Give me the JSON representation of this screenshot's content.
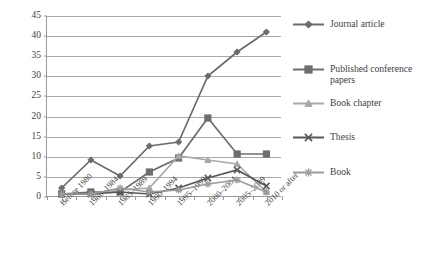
{
  "chart_data": {
    "type": "line",
    "title": "",
    "subtitle": "",
    "xlabel": "",
    "ylabel": "",
    "ylim": [
      0,
      45
    ],
    "ytick_step": 5,
    "yticks": [
      0,
      5,
      10,
      15,
      20,
      25,
      30,
      35,
      40,
      45
    ],
    "grid": "horizontal",
    "legend_position": "right",
    "categories": [
      "Before 1980",
      "1980–1984",
      "1985–1989",
      "1990–1994",
      "1995–1999",
      "2000–2004",
      "2005–2009",
      "2010 or after"
    ],
    "series": [
      {
        "name": "Journal article",
        "marker": "diamond",
        "color": "#6b6b6b",
        "values": [
          2,
          9,
          5,
          12.5,
          13.5,
          30,
          36,
          41
        ]
      },
      {
        "name": "Published conference papers",
        "marker": "square",
        "color": "#6e6e6e",
        "values": [
          0.5,
          1,
          1,
          6,
          9.5,
          19.5,
          10.5,
          10.5
        ]
      },
      {
        "name": "Book chapter",
        "marker": "triangle",
        "color": "#a8a8a8",
        "values": [
          0.5,
          0.5,
          1.5,
          2,
          10,
          9,
          8,
          1
        ]
      },
      {
        "name": "Thesis",
        "marker": "x",
        "color": "#575757",
        "values": [
          0.5,
          0.5,
          1,
          0.5,
          2,
          4.5,
          6.5,
          2.5
        ]
      },
      {
        "name": "Book",
        "marker": "asterisk",
        "color": "#9b9b9b",
        "values": [
          0.5,
          0.5,
          2,
          1,
          1.5,
          3,
          4,
          1
        ]
      }
    ]
  },
  "legend": {
    "items": [
      {
        "label": "Journal article"
      },
      {
        "label": "Published conference papers"
      },
      {
        "label": "Book chapter"
      },
      {
        "label": "Thesis"
      },
      {
        "label": "Book"
      }
    ]
  },
  "axes": {
    "y_tick_labels": [
      "0",
      "5",
      "10",
      "15",
      "20",
      "25",
      "30",
      "35",
      "40",
      "45"
    ],
    "x_tick_labels": [
      "Before 1980",
      "1980–1984",
      "1985–1989",
      "1990–1994",
      "1995–1999",
      "2000–2004",
      "2005–2009",
      "2010 or after"
    ]
  }
}
